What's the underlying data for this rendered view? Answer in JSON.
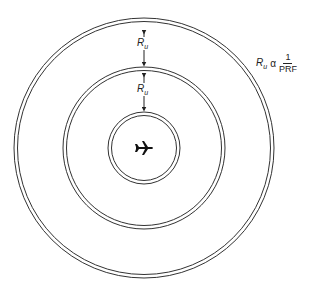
{
  "diagram": {
    "center_icon": "airplane-icon",
    "rings": [
      {
        "name": "inner",
        "radius": 35
      },
      {
        "name": "middle",
        "radius": 80
      },
      {
        "name": "outer",
        "radius": 130
      }
    ],
    "range_label_1": {
      "main": "R",
      "sub": "u"
    },
    "range_label_2": {
      "main": "R",
      "sub": "u"
    },
    "formula": {
      "lhs_main": "R",
      "lhs_sub": "u",
      "relation": "α",
      "numerator": "1",
      "denominator": "PRF"
    }
  }
}
